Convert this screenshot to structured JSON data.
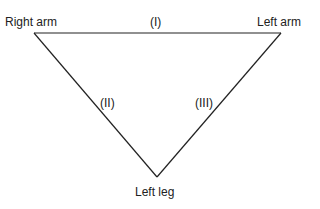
{
  "diagram": {
    "vertices": {
      "right_arm": "Right arm",
      "left_arm": "Left arm",
      "left_leg": "Left leg"
    },
    "leads": {
      "lead_1": "(I)",
      "lead_2": "(II)",
      "lead_3": "(III)"
    },
    "colors": {
      "line": "#222222",
      "background": "#ffffff"
    }
  }
}
